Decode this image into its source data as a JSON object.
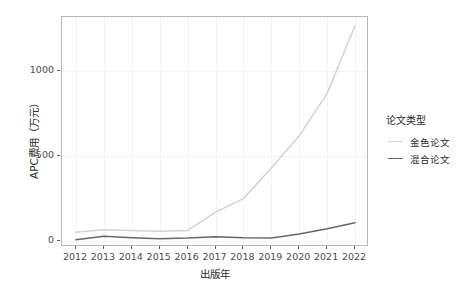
{
  "chart_data": {
    "type": "line",
    "title": "",
    "xlabel": "出版年",
    "ylabel": "APC费用（万元）",
    "x": [
      2012,
      2013,
      2014,
      2015,
      2016,
      2017,
      2018,
      2019,
      2020,
      2021,
      2022
    ],
    "xtick_labels": [
      "2012",
      "2013",
      "2014",
      "2015",
      "2016",
      "2017",
      "2018",
      "2019",
      "2020",
      "2021",
      "2022"
    ],
    "ytick_labels": [
      "0",
      "500",
      "1000"
    ],
    "yticks": [
      0,
      500,
      1000
    ],
    "ylim": [
      -35,
      1320
    ],
    "xlim": [
      2011.5,
      2022.5
    ],
    "grid": true,
    "legend_position": "right",
    "legend_title": "论文类型",
    "series": [
      {
        "name": "金色论文",
        "color": "#d3d3d3",
        "values": [
          52,
          66,
          62,
          58,
          62,
          170,
          250,
          430,
          620,
          870,
          1270
        ]
      },
      {
        "name": "混合论文",
        "color": "#676767",
        "values": [
          8,
          28,
          20,
          14,
          18,
          26,
          20,
          18,
          42,
          72,
          108
        ]
      }
    ]
  },
  "axes": {
    "y_title": "APC费用（万元）",
    "x_title": "出版年"
  },
  "legend": {
    "title": "论文类型",
    "items": [
      {
        "label": "金色论文",
        "color": "#d3d3d3"
      },
      {
        "label": "混合论文",
        "color": "#676767"
      }
    ]
  },
  "colors": {
    "panel_background": "#ffffff",
    "grid": "#f4f4f4",
    "panel_border": "#b8b8b8",
    "axis_text": "#4d4d4d",
    "title_text": "#2a2a2a",
    "gold_series": "#d3d3d3",
    "hybrid_series": "#676767"
  }
}
